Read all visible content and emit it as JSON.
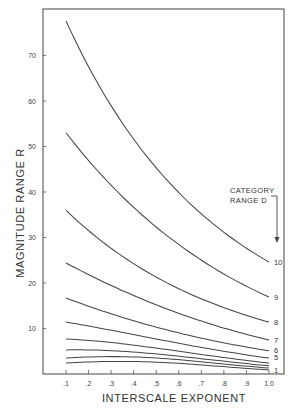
{
  "chart_data": {
    "type": "line",
    "title": "",
    "xlabel": "INTERSCALE EXPONENT",
    "ylabel": "MAGNITUDE RANGE R",
    "xlim": [
      0,
      1.05
    ],
    "ylim": [
      0,
      80
    ],
    "x_ticks": [
      0.1,
      0.2,
      0.3,
      0.4,
      0.5,
      0.6,
      0.7,
      0.8,
      0.9,
      1.0
    ],
    "x_tick_labels": [
      ".1",
      ".2",
      ".3",
      ".4",
      ".5",
      ".6",
      ".7",
      ".8",
      ".9",
      "1.0"
    ],
    "y_ticks": [
      10,
      20,
      30,
      40,
      50,
      60,
      70
    ],
    "y_tick_labels": [
      "10",
      "20",
      "30",
      "40",
      "50",
      "60",
      "70"
    ],
    "grid": false,
    "legend": {
      "title_line1": "CATEGORY",
      "title_line2": "RANGE D",
      "position": "right, with downward arrow"
    },
    "x": [
      0.1,
      0.5,
      1.0
    ],
    "series": [
      {
        "name": "10",
        "values": [
          77.6,
          45.3,
          24.6
        ]
      },
      {
        "name": "9",
        "values": [
          53.0,
          32.3,
          16.9
        ]
      },
      {
        "name": "8",
        "values": [
          36.0,
          21.3,
          11.4
        ]
      },
      {
        "name": "7",
        "values": [
          24.4,
          15.2,
          7.5
        ]
      },
      {
        "name": "6",
        "values": [
          16.7,
          10.3,
          5.1
        ]
      },
      {
        "name": "5",
        "values": [
          11.4,
          7.7,
          3.5
        ]
      },
      {
        "name": "4",
        "values": [
          7.7,
          5.7,
          2.4
        ]
      },
      {
        "name": "3",
        "values": [
          5.3,
          4.4,
          1.8
        ]
      },
      {
        "name": "2",
        "values": [
          3.5,
          3.5,
          1.3
        ]
      },
      {
        "name": "1",
        "values": [
          2.4,
          2.6,
          0.9
        ]
      }
    ],
    "curve_end_labels": [
      "10",
      "9",
      "8",
      "7",
      "6",
      "5",
      "1"
    ]
  },
  "labels": {
    "xlabel": "INTERSCALE EXPONENT",
    "ylabel": "MAGNITUDE RANGE R",
    "legend_line1": "CATEGORY",
    "legend_line2": "RANGE D"
  }
}
